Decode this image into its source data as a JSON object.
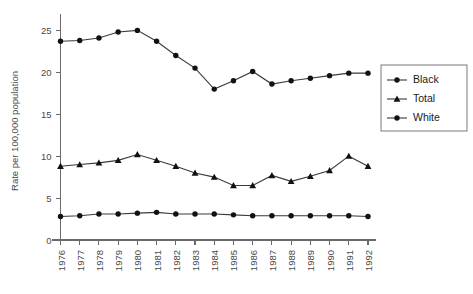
{
  "chart_data": {
    "type": "line",
    "title": "",
    "xlabel": "",
    "ylabel": "Rate per 100,000 population",
    "x": [
      1976,
      1977,
      1978,
      1979,
      1980,
      1981,
      1982,
      1983,
      1984,
      1985,
      1986,
      1987,
      1988,
      1989,
      1990,
      1991,
      1992
    ],
    "categories": [
      "1976",
      "1977",
      "1978",
      "1979",
      "1980",
      "1981",
      "1982",
      "1983",
      "1984",
      "1985",
      "1986",
      "1987",
      "1988",
      "1989",
      "1990",
      "1991",
      "1992"
    ],
    "ylim": [
      0,
      26
    ],
    "yticks": [
      0,
      5,
      10,
      15,
      20,
      25
    ],
    "ytick_labels": [
      "0",
      "5",
      "10",
      "15",
      "20",
      "25"
    ],
    "grid": false,
    "legend_position": "right",
    "series": [
      {
        "name": "Black",
        "marker": "circle",
        "color": "#111111",
        "values": [
          23.7,
          23.8,
          24.1,
          24.8,
          25.0,
          23.7,
          22.0,
          20.5,
          18.0,
          19.0,
          20.1,
          18.6,
          19.0,
          19.3,
          19.6,
          19.9,
          19.9
        ]
      },
      {
        "name": "Total",
        "marker": "triangle",
        "color": "#111111",
        "values": [
          8.8,
          9.0,
          9.2,
          9.5,
          10.2,
          9.5,
          8.8,
          8.0,
          7.5,
          6.5,
          6.5,
          7.7,
          7.0,
          7.6,
          8.3,
          10.0,
          8.8
        ]
      },
      {
        "name": "White",
        "marker": "circle",
        "color": "#111111",
        "values": [
          2.8,
          2.9,
          3.1,
          3.1,
          3.2,
          3.3,
          3.1,
          3.1,
          3.1,
          3.0,
          2.9,
          2.9,
          2.9,
          2.9,
          2.9,
          2.9,
          2.8
        ]
      }
    ]
  },
  "legend": {
    "items": [
      {
        "label": "Black"
      },
      {
        "label": "Total"
      },
      {
        "label": "White"
      }
    ]
  },
  "axes": {
    "y_title": "Rate per 100,000 population",
    "y_tick_labels": [
      "0",
      "5",
      "10",
      "15",
      "20",
      "25"
    ],
    "x_tick_labels": [
      "1976",
      "1977",
      "1978",
      "1979",
      "1980",
      "1981",
      "1982",
      "1983",
      "1984",
      "1985",
      "1986",
      "1987",
      "1988",
      "1989",
      "1990",
      "1991",
      "1992"
    ]
  }
}
